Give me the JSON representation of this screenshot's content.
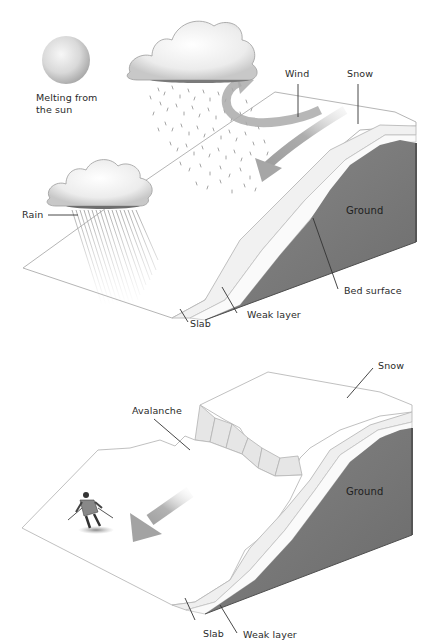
{
  "diagram": {
    "topic": "Avalanche formation",
    "colors": {
      "background": "#ffffff",
      "snow_outline": "#b9b9b9",
      "ground": "#777777",
      "ground_dark": "#5e5e5e",
      "arrow": "#a9a9a9",
      "label_text": "#2a2a2a",
      "leader_line": "#333333"
    },
    "panels": [
      {
        "id": "before",
        "labels": {
          "sun": "Melting from the sun",
          "sun_line1": "Melting from",
          "sun_line2": "the sun",
          "wind": "Wind",
          "snow": "Snow",
          "rain": "Rain",
          "ground": "Ground",
          "bed_surface": "Bed surface",
          "weak_layer": "Weak layer",
          "slab": "Slab"
        }
      },
      {
        "id": "after",
        "labels": {
          "snow": "Snow",
          "avalanche": "Avalanche",
          "ground": "Ground",
          "weak_layer": "Weak layer",
          "slab": "Slab"
        }
      }
    ]
  }
}
